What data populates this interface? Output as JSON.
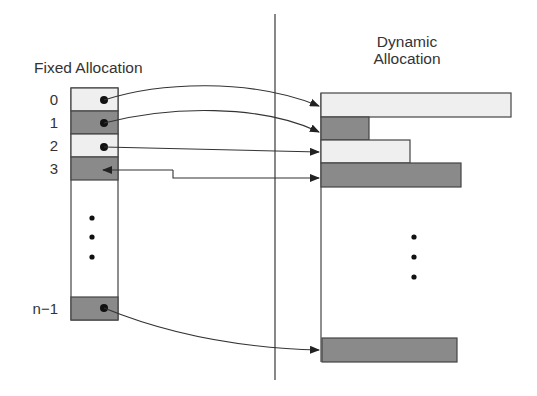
{
  "left": {
    "title": "Fixed Allocation",
    "index_labels": [
      "0",
      "1",
      "2",
      "3",
      "n−1"
    ]
  },
  "right": {
    "title_line1": "Dynamic",
    "title_line2": "Allocation"
  },
  "colors": {
    "light_fill": "#efefef",
    "dark_fill": "#8a8a8a",
    "stroke": "#444444",
    "divider": "#555555"
  },
  "ellipsis": "…"
}
